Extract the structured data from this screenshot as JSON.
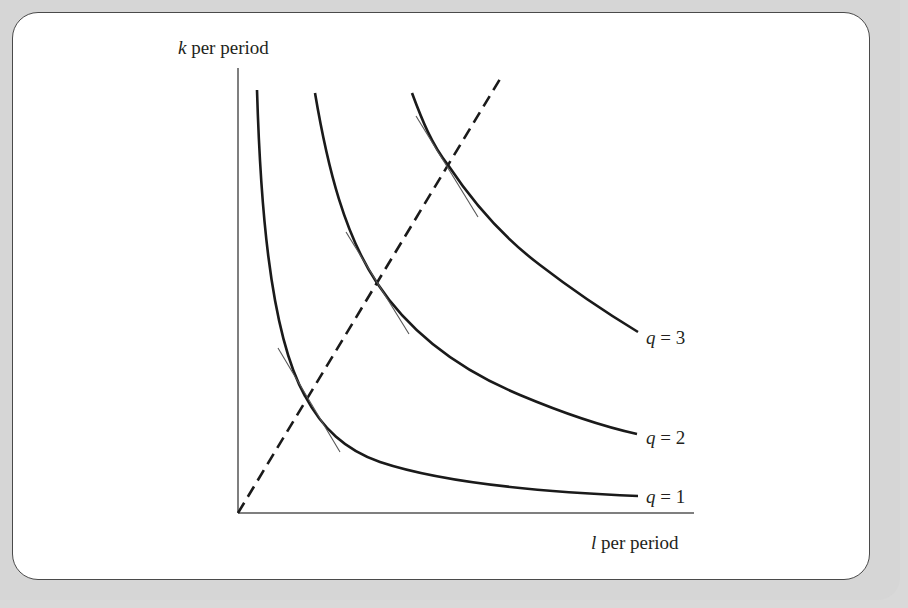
{
  "diagram": {
    "y_axis_label": {
      "var": "k",
      "rest": " per period"
    },
    "x_axis_label": {
      "var": "l",
      "rest": " per period"
    },
    "curves": [
      {
        "id": "q1",
        "label_var": "q",
        "label_rest": " = 1"
      },
      {
        "id": "q2",
        "label_var": "q",
        "label_rest": " = 2"
      },
      {
        "id": "q3",
        "label_var": "q",
        "label_rest": " = 3"
      }
    ],
    "expansion_path_style": "dashed",
    "colors": {
      "curve": "#1a1a1a",
      "tangent": "#555555",
      "axis": "#555555",
      "frame_bg": "#d6d6d6",
      "panel_bg": "#ffffff"
    }
  }
}
